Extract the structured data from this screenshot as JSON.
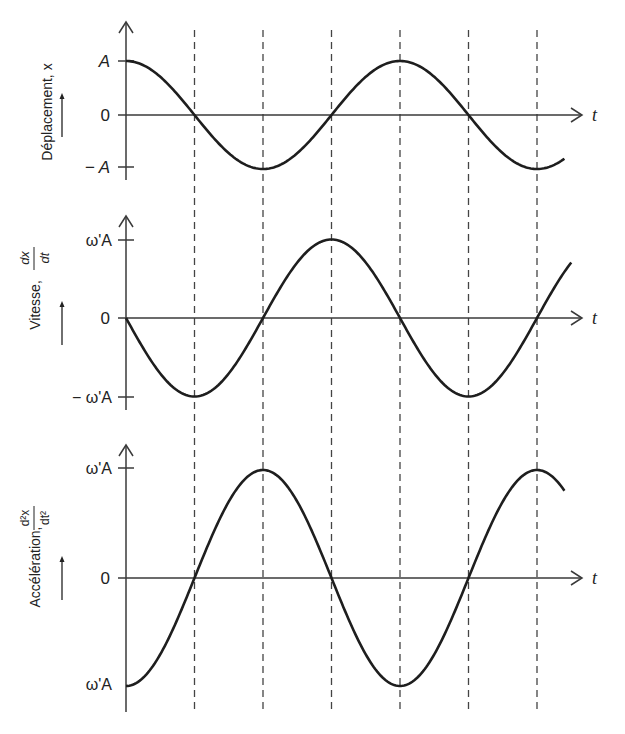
{
  "chart_data": [
    {
      "type": "line",
      "title": "",
      "ylabel": "Déplacement, x",
      "xlabel": "t",
      "yticks": [
        "A",
        "0",
        "− A"
      ],
      "ytick_values": [
        1,
        0,
        -1
      ],
      "function": "A·cos(ω't)",
      "x": [
        0,
        0.5,
        1,
        1.5,
        2,
        2.5,
        3
      ],
      "x_units": "multiples of π (one dashed line per π/2)",
      "values": [
        1,
        0,
        -1,
        0,
        1,
        0,
        -1
      ],
      "x_end": 3.2,
      "ylim": [
        -1,
        1
      ]
    },
    {
      "type": "line",
      "title": "",
      "ylabel": "Vitesse, dx/dt",
      "ylabel_main": "Vitesse,",
      "ylabel_frac_num": "dx",
      "ylabel_frac_den": "dt",
      "xlabel": "t",
      "yticks": [
        "ω'A",
        "0",
        "− ω'A"
      ],
      "ytick_values": [
        1,
        0,
        -1
      ],
      "function": "−ω'A·sin(ω't)",
      "x": [
        0,
        0.5,
        1,
        1.5,
        2,
        2.5,
        3
      ],
      "values": [
        0,
        -1,
        0,
        1,
        0,
        -1,
        0
      ],
      "x_end": 3.25,
      "ylim": [
        -1,
        1
      ]
    },
    {
      "type": "line",
      "title": "",
      "ylabel": "Accélération, d²x/dt²",
      "ylabel_main": "Accélération,",
      "ylabel_frac_num": "d²x",
      "ylabel_frac_den": "dt²",
      "xlabel": "t",
      "yticks": [
        "ω'A",
        "0",
        "ω'A"
      ],
      "ytick_values": [
        1,
        0,
        -1
      ],
      "function": "−ω'²A·cos(ω't)",
      "x": [
        0,
        0.5,
        1,
        1.5,
        2,
        2.5,
        3
      ],
      "values": [
        -1,
        0,
        1,
        0,
        -1,
        0,
        1
      ],
      "x_end": 3.2,
      "ylim": [
        -1,
        1
      ]
    }
  ],
  "labels": {
    "t": "t",
    "panel1": {
      "ylabel": "Déplacement, x",
      "tick_top": "A",
      "tick_zero": "0",
      "tick_bottom": "− A"
    },
    "panel2": {
      "ylabel": "Vitesse,",
      "frac_num": "dx",
      "frac_den": "dt",
      "tick_top": "ω'A",
      "tick_zero": "0",
      "tick_bottom": "− ω'A"
    },
    "panel3": {
      "ylabel": "Accélération,",
      "frac_num": "d²x",
      "frac_den": "dt²",
      "tick_top": "ω'A",
      "tick_zero": "0",
      "tick_bottom": "ω'A"
    }
  },
  "style": {
    "ink": "#1e1e1e",
    "axis": "#3a3a3a",
    "dash": "#444444"
  }
}
